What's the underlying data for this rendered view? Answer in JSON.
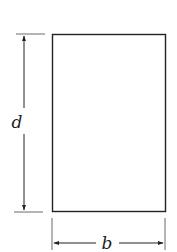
{
  "diagram": {
    "labels": {
      "height": "d",
      "width": "b"
    },
    "colors": {
      "stroke": "#222222",
      "background": "#ffffff"
    }
  }
}
